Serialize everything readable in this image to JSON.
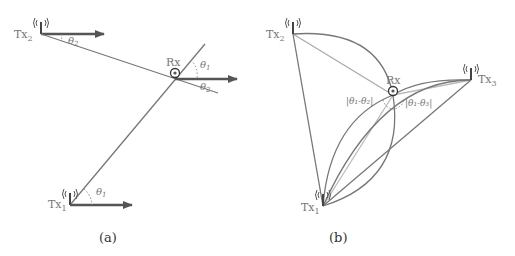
{
  "panel_a": {
    "caption": "(a)",
    "tx2_label": "Tx",
    "tx2_sub": "2",
    "tx1_label": "Tx",
    "tx1_sub": "1",
    "rx_label": "Rx",
    "angle_theta2_top": "θ",
    "angle_theta2_top_sub": "2",
    "angle_theta1_rx": "θ",
    "angle_theta1_rx_sub": "1",
    "angle_theta2_rx": "θ",
    "angle_theta2_rx_sub": "2",
    "angle_theta1_bottom": "θ",
    "angle_theta1_bottom_sub": "1"
  },
  "panel_b": {
    "caption": "(b)",
    "tx1_label": "Tx",
    "tx1_sub": "1",
    "tx2_label": "Tx",
    "tx2_sub": "2",
    "tx3_label": "Tx",
    "tx3_sub": "3",
    "rx_label": "Rx",
    "diff12": "|θ₁-θ₂|",
    "diff13": "|θ₁-θ₃|"
  },
  "colors": {
    "line": "#777777",
    "light_line": "#aaaaaa",
    "arrow": "#555555"
  }
}
